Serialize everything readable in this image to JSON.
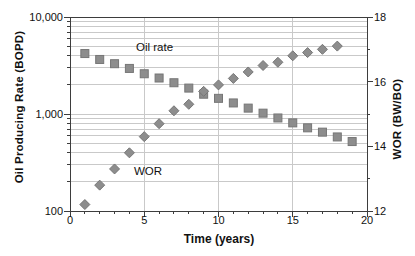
{
  "style": {
    "background": "#ffffff",
    "grid_color": "#c9c9c9",
    "axis_color": "#3d3d3d",
    "text_color": "#111111",
    "marker_fill": "#8d8d8d",
    "marker_stroke": "#767676"
  },
  "chart_data": {
    "type": "scatter",
    "title": "",
    "legend": "none",
    "grid": {
      "horizontal": "log-minor",
      "vertical_at_major_x": true
    },
    "x": {
      "label": "Time (years)",
      "min": 0,
      "max": 20,
      "minor_step": 1,
      "grid_at": [
        5,
        10,
        15
      ],
      "ticks": [
        {
          "value": 0,
          "label": "0"
        },
        {
          "value": 5,
          "label": "5"
        },
        {
          "value": 10,
          "label": "10"
        },
        {
          "value": 15,
          "label": "15"
        },
        {
          "value": 20,
          "label": "20"
        }
      ]
    },
    "y_left": {
      "label": "Oil Producing Rate (BOPD)",
      "scale": "log",
      "min": 100,
      "max": 10000,
      "ticks": [
        {
          "value": 100,
          "label": "100"
        },
        {
          "value": 1000,
          "label": "1,000"
        },
        {
          "value": 10000,
          "label": "10,000"
        }
      ]
    },
    "y_right": {
      "label": "WOR (BW/BO)",
      "scale": "linear",
      "min": 12,
      "max": 18,
      "minor_ticks": [
        13,
        15,
        17
      ],
      "ticks": [
        {
          "value": 12,
          "label": "12"
        },
        {
          "value": 14,
          "label": "14"
        },
        {
          "value": 16,
          "label": "16"
        },
        {
          "value": 18,
          "label": "18"
        }
      ]
    },
    "series": [
      {
        "name": "Oil rate",
        "axis": "left",
        "marker": "square",
        "x": [
          1,
          2,
          3,
          4,
          5,
          6,
          7,
          8,
          9,
          10,
          11,
          12,
          13,
          14,
          15,
          16,
          17,
          18,
          19
        ],
        "y": [
          4200,
          3650,
          3300,
          2950,
          2600,
          2350,
          2100,
          1850,
          1600,
          1450,
          1300,
          1150,
          1020,
          910,
          810,
          720,
          650,
          580,
          520
        ]
      },
      {
        "name": "WOR",
        "axis": "right",
        "marker": "diamond",
        "x": [
          1,
          2,
          3,
          4,
          5,
          6,
          7,
          8,
          9,
          10,
          11,
          12,
          13,
          14,
          15,
          16,
          17,
          18
        ],
        "y": [
          12.2,
          12.8,
          13.3,
          13.8,
          14.3,
          14.7,
          15.1,
          15.3,
          15.7,
          15.9,
          16.1,
          16.3,
          16.5,
          16.6,
          16.8,
          16.9,
          17.0,
          17.1
        ]
      }
    ]
  }
}
